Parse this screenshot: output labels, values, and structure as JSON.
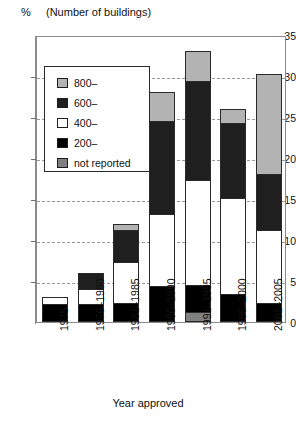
{
  "header": {
    "unit_symbol": "%",
    "note": "(Number of buildings)"
  },
  "axis": {
    "x_title": "Year approved",
    "y_ticks": [
      "0",
      "5",
      "10",
      "15",
      "20",
      "25",
      "30",
      "35"
    ],
    "x_ticks": [
      "1975",
      "1976–1980",
      "1981–1985",
      "1986–1990",
      "1991–1995",
      "1996–2000",
      "2001–2005"
    ]
  },
  "legend": {
    "items": [
      {
        "label": "800–",
        "key": "s800",
        "color": "#b3b3b3"
      },
      {
        "label": "600–",
        "key": "s600",
        "color": "#1f1f1f"
      },
      {
        "label": "400–",
        "key": "s400",
        "color": "#ffffff"
      },
      {
        "label": "200–",
        "key": "s200",
        "color": "#000000"
      },
      {
        "label": "not reported",
        "key": "not_reported",
        "color": "#808080"
      }
    ]
  },
  "chart_data": {
    "type": "bar",
    "subtype": "stacked",
    "title": "",
    "subtitle": "(Number of buildings)",
    "xlabel": "Year approved",
    "ylabel": "%",
    "ylim": [
      0,
      35
    ],
    "ytick_step": 5,
    "grid": true,
    "legend_position": "inside-upper-left",
    "categories": [
      "1975",
      "1976–1980",
      "1981–1985",
      "1986–1990",
      "1991–1995",
      "1996–2000",
      "2001–2005"
    ],
    "stack_order_bottom_to_top": [
      "not reported",
      "200–",
      "400–",
      "600–",
      "800–"
    ],
    "series": [
      {
        "name": "not reported",
        "color": "#808080",
        "values": [
          0,
          0,
          0,
          0,
          1.0,
          0,
          0
        ]
      },
      {
        "name": "200–",
        "color": "#000000",
        "values": [
          2.1,
          2.1,
          2.1,
          4.2,
          3.3,
          3.2,
          2.1
        ]
      },
      {
        "name": "400–",
        "color": "#ffffff",
        "values": [
          0.9,
          1.9,
          5.1,
          8.8,
          12.9,
          11.8,
          9.0
        ]
      },
      {
        "name": "600–",
        "color": "#1f1f1f",
        "values": [
          0,
          2.0,
          4.0,
          11.5,
          12.2,
          9.3,
          6.9
        ]
      },
      {
        "name": "800–",
        "color": "#b3b3b3",
        "values": [
          0,
          0,
          0.8,
          3.5,
          3.6,
          1.7,
          12.3
        ]
      }
    ],
    "totals": [
      3.0,
      6.0,
      12.0,
      28.0,
      33.0,
      26.0,
      30.3
    ]
  }
}
